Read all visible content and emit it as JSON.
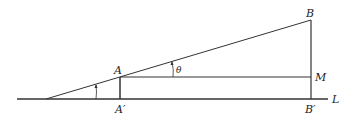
{
  "diagram": {
    "type": "geometry",
    "colors": {
      "stroke": "#333333",
      "background": "#ffffff"
    },
    "labels": {
      "A": "A",
      "A_prime": "A′",
      "B": "B",
      "B_prime": "B′",
      "M": "M",
      "L": "L",
      "theta": "θ"
    },
    "points": {
      "O": [
        46,
        99
      ],
      "A": [
        120,
        77
      ],
      "A_prime": [
        120,
        99
      ],
      "B": [
        311,
        20
      ],
      "B_prime": [
        311,
        99
      ],
      "M": [
        311,
        77
      ]
    }
  }
}
